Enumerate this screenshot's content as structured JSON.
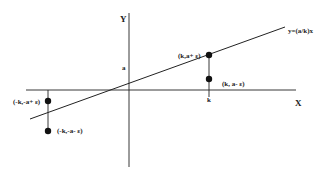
{
  "diagram": {
    "axes": {
      "x_label": "X",
      "y_label": "Y"
    },
    "line_label": "y=(a/k)x",
    "tick_labels": {
      "y_tick": "a",
      "x_tick": "k"
    },
    "points": [
      {
        "id": "p1",
        "label": "(k,a+ ε)"
      },
      {
        "id": "p2",
        "label": "(k, a- ε)"
      },
      {
        "id": "p3",
        "label": "(-k,-a+ ε)"
      },
      {
        "id": "p4",
        "label": "(-k,-a- ε)"
      }
    ],
    "colors": {
      "ink": "#222222",
      "background": "#ffffff"
    }
  }
}
